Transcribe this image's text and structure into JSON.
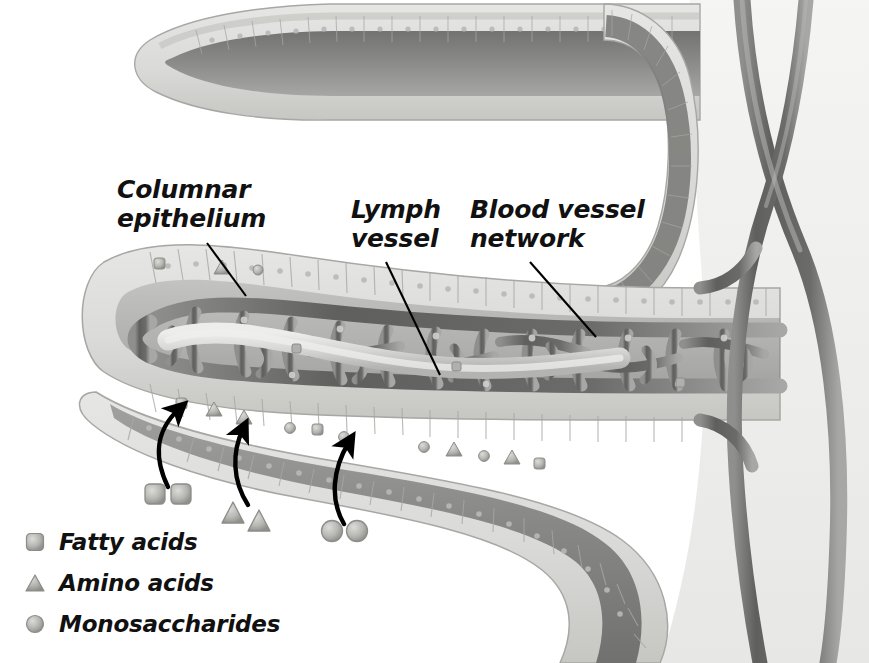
{
  "figure": {
    "kind": "biology-illustration",
    "background_color": "#ffffff",
    "style": "grayscale shaded anatomical drawing"
  },
  "palette": {
    "background": "#ffffff",
    "epithelium_fill": "#d9d9d7",
    "epithelium_line": "#a8a7a3",
    "core_dark": "#8a8a88",
    "core_darker": "#6f6f6d",
    "vessel_dark": "#6a6a68",
    "vessel_light": "#cfcfcd",
    "lymph_fill": "#d2d2d0",
    "label_text": "#111111",
    "leader_line": "#000000",
    "arrow": "#000000",
    "molecule_fill": "#b4b4b0",
    "molecule_edge": "#8c8c88"
  },
  "callouts": [
    {
      "id": "columnar-epithelium",
      "lines": [
        "Columnar",
        "epithelium"
      ],
      "text": "Columnar epithelium",
      "label_x": 117,
      "label_y": 176,
      "leader": {
        "x1": 207,
        "y1": 243,
        "x2": 246,
        "y2": 296
      }
    },
    {
      "id": "lymph-vessel",
      "lines": [
        "Lymph",
        "vessel"
      ],
      "text": "Lymph vessel",
      "label_x": 351,
      "label_y": 196,
      "leader": {
        "x1": 386,
        "y1": 262,
        "x2": 440,
        "y2": 375
      }
    },
    {
      "id": "blood-vessel-network",
      "lines": [
        "Blood vessel",
        "network"
      ],
      "text": "Blood vessel network",
      "label_x": 470,
      "label_y": 196,
      "leader": {
        "x1": 530,
        "y1": 262,
        "x2": 596,
        "y2": 337
      }
    }
  ],
  "legend": {
    "items": [
      {
        "id": "fatty-acids",
        "label": "Fatty acids",
        "shape": "rounded-square",
        "color": "#b4b4b0"
      },
      {
        "id": "amino-acids",
        "label": "Amino acids",
        "shape": "triangle",
        "color": "#a9a9a5"
      },
      {
        "id": "monosaccharides",
        "label": "Monosaccharides",
        "shape": "circle",
        "color": "#b0b0ac"
      }
    ]
  },
  "absorption_arrows": [
    {
      "id": "arrow-fatty-acids",
      "molecule": "fatty-acids",
      "from_x": 168,
      "from_y": 487,
      "to_x": 182,
      "to_y": 404
    },
    {
      "id": "arrow-amino-acids",
      "molecule": "amino-acids",
      "from_x": 246,
      "from_y": 505,
      "to_x": 243,
      "to_y": 424
    },
    {
      "id": "arrow-monosaccharides",
      "molecule": "monosaccharides",
      "from_x": 342,
      "from_y": 524,
      "to_x": 349,
      "to_y": 437
    }
  ],
  "lumen_molecules": [
    {
      "shape": "rounded-square",
      "x": 154,
      "y": 494
    },
    {
      "shape": "rounded-square",
      "x": 181,
      "y": 494
    },
    {
      "shape": "triangle",
      "x": 233,
      "y": 512
    },
    {
      "shape": "triangle",
      "x": 259,
      "y": 519
    },
    {
      "shape": "circle",
      "x": 332,
      "y": 531
    },
    {
      "shape": "circle",
      "x": 357,
      "y": 531
    }
  ],
  "structures": [
    {
      "id": "villus-upper",
      "name": "Upper villus (partial, top of frame)"
    },
    {
      "id": "villus-middle",
      "name": "Central villus with capillary network and lacteal"
    },
    {
      "id": "villus-lower",
      "name": "Lower villus curving to right"
    },
    {
      "id": "capillary-network",
      "name": "Blood vessel network mesh inside villus core"
    },
    {
      "id": "lacteal",
      "name": "Central lymph vessel (lacteal)"
    },
    {
      "id": "submucosal-vessels",
      "name": "Crossing vessels at right margin"
    }
  ]
}
